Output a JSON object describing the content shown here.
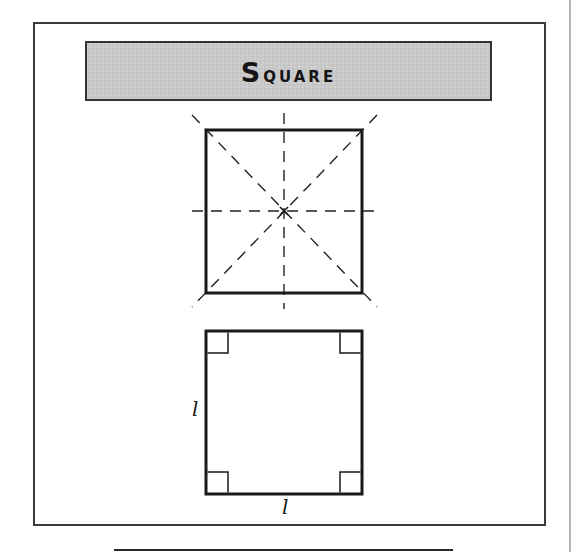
{
  "title": "Square",
  "figures": [
    {
      "id": "symmetry-square",
      "description": "Square with lines of symmetry (dashed) and center point",
      "square": {
        "x": 206,
        "y": 130,
        "width": 156,
        "height": 163
      },
      "center": {
        "x": 284,
        "y": 211
      },
      "lines_of_symmetry": 4
    },
    {
      "id": "side-length-square",
      "description": "Square with four right-angle markers and equal side labels",
      "square": {
        "x": 206,
        "y": 331,
        "width": 156,
        "height": 163
      },
      "right_angle_marker_size": 21,
      "labels": {
        "left_side": "l",
        "bottom_side": "l"
      }
    }
  ],
  "colors": {
    "stroke": "#1a1a1a",
    "banner_fill": "#c9c9c9",
    "page_edge": "#b5b5b5"
  }
}
